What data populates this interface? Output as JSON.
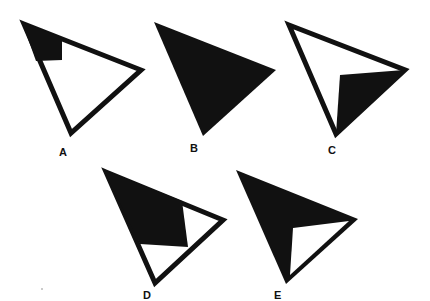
{
  "figure": {
    "fill_color": "#111111",
    "background_color": "#ffffff",
    "options": [
      {
        "label": "A",
        "style": "outlined triangle with small black quadrilateral at top-left vertex"
      },
      {
        "label": "B",
        "style": "fully filled black triangle"
      },
      {
        "label": "C",
        "style": "outlined triangle with black triangular region toward right and bottom vertices"
      },
      {
        "label": "D",
        "style": "outlined triangle with large black quadrilateral covering top-left portion"
      },
      {
        "label": "E",
        "style": "black triangle with white triangular notch toward bottom-right"
      }
    ]
  }
}
